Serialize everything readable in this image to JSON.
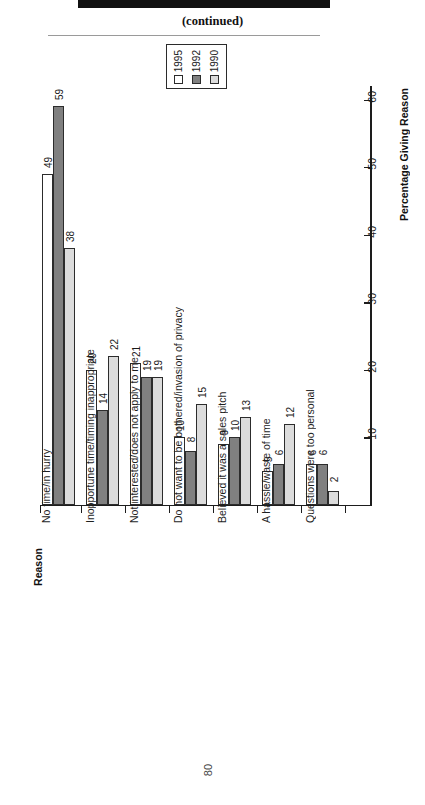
{
  "document": {
    "continued_label": "(continued)",
    "page_number": "80"
  },
  "legend": {
    "entries": [
      {
        "label": "1995",
        "color": "#ffffff"
      },
      {
        "label": "1992",
        "color": "#808080"
      },
      {
        "label": "1990",
        "color": "#dcdcdc"
      }
    ]
  },
  "chart_data": {
    "type": "bar",
    "title": "(continued)",
    "xlabel": "Reason",
    "ylabel": "Percentage Giving Reason",
    "ylim": [
      0,
      62
    ],
    "yticks": [
      0,
      10,
      20,
      30,
      40,
      50,
      60
    ],
    "ytick_labels": [
      "0",
      "10",
      "20",
      "30",
      "40",
      "50",
      "60"
    ],
    "grid": false,
    "legend_position": "top-center",
    "orientation": "vertical",
    "categories": [
      "No time/in hurry",
      "Inopportune time/timing inappropriate",
      "Not interested/does not apply to me",
      "Do not want to be bothered/invasion of privacy",
      "Believed it was a sales pitch",
      "A hassle/waste of time",
      "Questions were too personal"
    ],
    "series": [
      {
        "name": "1995",
        "color": "#ffffff",
        "values": [
          49,
          20,
          21,
          10,
          9,
          5,
          6
        ]
      },
      {
        "name": "1992",
        "color": "#808080",
        "values": [
          59,
          14,
          19,
          8,
          10,
          6,
          6
        ]
      },
      {
        "name": "1990",
        "color": "#dcdcdc",
        "values": [
          38,
          22,
          19,
          15,
          13,
          12,
          2
        ]
      }
    ]
  }
}
